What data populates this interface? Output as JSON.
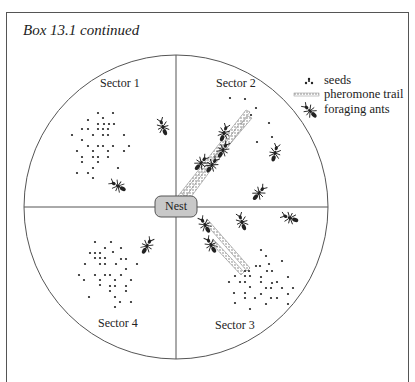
{
  "box_title": "Box 13.1 continued",
  "nest_label": "Nest",
  "sectors": [
    {
      "label": "Sector 1"
    },
    {
      "label": "Sector 2"
    },
    {
      "label": "Sector 3"
    },
    {
      "label": "Sector 4"
    }
  ],
  "legend": {
    "seeds": "seeds",
    "pheromone_trail": "pheromone trail",
    "foraging_ants": "foraging ants"
  },
  "colors": {
    "line": "#555555",
    "ink": "#222222",
    "nest_fill": "#c8c8c8"
  }
}
